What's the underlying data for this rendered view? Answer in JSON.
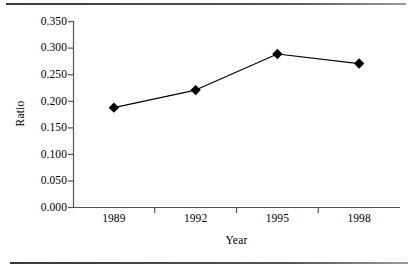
{
  "chart_data": {
    "type": "line",
    "title": "",
    "subtitle": "",
    "xlabel": "Year",
    "ylabel": "Ratio",
    "categories": [
      "1989",
      "1992",
      "1995",
      "1998"
    ],
    "values": [
      0.188,
      0.221,
      0.289,
      0.271
    ],
    "series": [
      {
        "name": "Ratio",
        "values": [
          0.188,
          0.221,
          0.289,
          0.271
        ]
      }
    ],
    "ylim": [
      0.0,
      0.35
    ],
    "ytick_values": [
      0.0,
      0.05,
      0.1,
      0.15,
      0.2,
      0.25,
      0.3,
      0.35
    ],
    "ytick_labels": [
      "0.000",
      "0.050",
      "0.100",
      "0.150",
      "0.200",
      "0.250",
      "0.300",
      "0.350"
    ],
    "xtick_labels": [
      "1989",
      "1992",
      "1995",
      "1998"
    ],
    "grid": false,
    "legend": false,
    "legend_position": "none",
    "marker": "diamond",
    "line_color": "#000000",
    "marker_color": "#000000",
    "axis_color": "#555555",
    "background_color": "#ffffff",
    "annotations": []
  },
  "decorations": {
    "top_rule": "horizontal-rule",
    "bottom_rule": "horizontal-rule"
  }
}
